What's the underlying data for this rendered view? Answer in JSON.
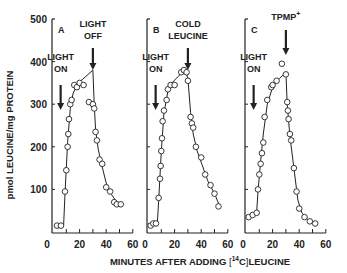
{
  "figure": {
    "ylabel": "pmol LEUCINE/mg PROTEIN",
    "xlabel": "MINUTES AFTER ADDING [14C] LEUCINE",
    "xlabel_parts": {
      "pre": "MINUTES AFTER ADDING ",
      "bracket_open": "[",
      "sup": "14",
      "elem": "C",
      "bracket_close": "]",
      "post": "LEUCINE"
    },
    "yticks": [
      "500",
      "400",
      "300",
      "200",
      "100"
    ],
    "xticks": [
      "0",
      "20",
      "40",
      "60"
    ]
  },
  "chart_data": [
    {
      "type": "line",
      "panel": "A",
      "xlabel": "MINUTES AFTER ADDING [14C] LEUCINE",
      "ylabel": "pmol LEUCINE/mg PROTEIN",
      "xlim": [
        0,
        60
      ],
      "ylim": [
        0,
        500
      ],
      "xticks": [
        0,
        20,
        40,
        60
      ],
      "yticks": [
        100,
        200,
        300,
        400,
        500
      ],
      "annotations": [
        {
          "text": "LIGHT ON",
          "x": 8
        },
        {
          "text": "LIGHT OFF",
          "x": 30
        }
      ],
      "points": [
        [
          3,
          15
        ],
        [
          6,
          15
        ],
        [
          9,
          95
        ],
        [
          10,
          145
        ],
        [
          11,
          200
        ],
        [
          11.5,
          230
        ],
        [
          12,
          265
        ],
        [
          13,
          300
        ],
        [
          14,
          310
        ],
        [
          16,
          345
        ],
        [
          18,
          340
        ],
        [
          20,
          350
        ],
        [
          23,
          345
        ],
        [
          27,
          305
        ],
        [
          30,
          300
        ],
        [
          31,
          290
        ],
        [
          32,
          235
        ],
        [
          33,
          215
        ],
        [
          35,
          170
        ],
        [
          37,
          160
        ],
        [
          40,
          105
        ],
        [
          43,
          95
        ],
        [
          46,
          70
        ],
        [
          48,
          65
        ],
        [
          51,
          65
        ]
      ],
      "curve": [
        [
          2,
          15
        ],
        [
          8,
          15
        ],
        [
          9,
          90
        ],
        [
          10,
          150
        ],
        [
          11,
          210
        ],
        [
          13,
          290
        ],
        [
          15,
          325
        ],
        [
          18,
          345
        ],
        [
          20,
          352
        ],
        [
          30,
          380
        ],
        [
          31,
          300
        ],
        [
          32,
          240
        ],
        [
          34,
          195
        ],
        [
          36,
          165
        ],
        [
          40,
          115
        ],
        [
          44,
          88
        ],
        [
          48,
          70
        ],
        [
          52,
          62
        ]
      ]
    },
    {
      "type": "line",
      "panel": "B",
      "xlabel": "MINUTES AFTER ADDING [14C] LEUCINE",
      "ylabel": "pmol LEUCINE/mg PROTEIN",
      "xlim": [
        0,
        60
      ],
      "ylim": [
        0,
        500
      ],
      "xticks": [
        0,
        20,
        40,
        60
      ],
      "yticks": [
        100,
        200,
        300,
        400,
        500
      ],
      "annotations": [
        {
          "text": "LIGHT ON",
          "x": 8
        },
        {
          "text": "COLD LEUCINE",
          "x": 30
        }
      ],
      "points": [
        [
          2,
          15
        ],
        [
          4,
          20
        ],
        [
          6,
          20
        ],
        [
          8,
          80
        ],
        [
          9,
          125
        ],
        [
          9.5,
          155
        ],
        [
          10,
          190
        ],
        [
          10.5,
          220
        ],
        [
          11,
          260
        ],
        [
          12,
          285
        ],
        [
          14,
          310
        ],
        [
          15,
          335
        ],
        [
          17,
          345
        ],
        [
          20,
          345
        ],
        [
          25,
          375
        ],
        [
          27,
          380
        ],
        [
          29,
          375
        ],
        [
          30,
          355
        ],
        [
          32,
          270
        ],
        [
          33,
          255
        ],
        [
          34,
          245
        ],
        [
          36,
          200
        ],
        [
          40,
          175
        ],
        [
          43,
          135
        ],
        [
          47,
          110
        ],
        [
          50,
          90
        ],
        [
          53,
          60
        ]
      ],
      "curve": [
        [
          0,
          20
        ],
        [
          7,
          20
        ],
        [
          8,
          70
        ],
        [
          10,
          190
        ],
        [
          12,
          280
        ],
        [
          15,
          330
        ],
        [
          18,
          350
        ],
        [
          28,
          382
        ],
        [
          30,
          360
        ],
        [
          32,
          280
        ],
        [
          34,
          230
        ],
        [
          37,
          190
        ],
        [
          41,
          155
        ],
        [
          45,
          120
        ],
        [
          50,
          90
        ],
        [
          54,
          60
        ]
      ]
    },
    {
      "type": "line",
      "panel": "C",
      "xlabel": "MINUTES AFTER ADDING [14C] LEUCINE",
      "ylabel": "pmol LEUCINE/mg PROTEIN",
      "xlim": [
        0,
        60
      ],
      "ylim": [
        0,
        500
      ],
      "xticks": [
        0,
        20,
        40,
        60
      ],
      "yticks": [
        100,
        200,
        300,
        400,
        500
      ],
      "annotations": [
        {
          "text": "LIGHT ON",
          "x": 8
        },
        {
          "text": "TPMP+",
          "x": 30
        }
      ],
      "points": [
        [
          2,
          35
        ],
        [
          5,
          40
        ],
        [
          8,
          45
        ],
        [
          9,
          100
        ],
        [
          10,
          135
        ],
        [
          11,
          160
        ],
        [
          12,
          185
        ],
        [
          13,
          210
        ],
        [
          14,
          270
        ],
        [
          16,
          310
        ],
        [
          19,
          340
        ],
        [
          20,
          345
        ],
        [
          23,
          355
        ],
        [
          27,
          395
        ],
        [
          30,
          370
        ],
        [
          31,
          305
        ],
        [
          31.5,
          285
        ],
        [
          32,
          265
        ],
        [
          33,
          230
        ],
        [
          34,
          215
        ],
        [
          36,
          150
        ],
        [
          38,
          95
        ],
        [
          40,
          55
        ],
        [
          44,
          35
        ],
        [
          48,
          25
        ],
        [
          52,
          20
        ]
      ],
      "curve": [
        [
          0,
          35
        ],
        [
          8,
          45
        ],
        [
          9,
          95
        ],
        [
          11,
          165
        ],
        [
          13,
          230
        ],
        [
          16,
          300
        ],
        [
          20,
          340
        ],
        [
          25,
          360
        ],
        [
          30,
          375
        ],
        [
          31,
          300
        ],
        [
          33,
          225
        ],
        [
          36,
          150
        ],
        [
          39,
          75
        ],
        [
          42,
          45
        ],
        [
          46,
          30
        ],
        [
          52,
          20
        ]
      ]
    }
  ]
}
